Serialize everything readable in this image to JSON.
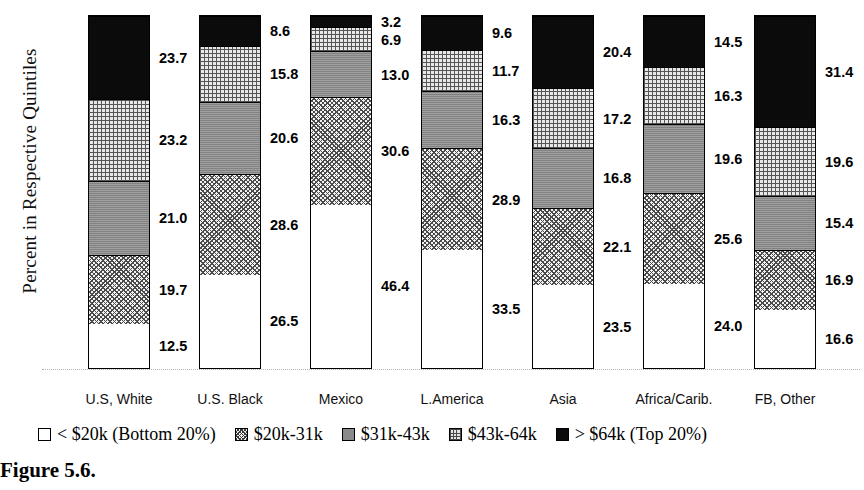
{
  "figure": {
    "caption": "Figure 5.6."
  },
  "chart_data": {
    "type": "bar",
    "stacked": true,
    "title": "",
    "xlabel": "",
    "ylabel": "Percent in Respective Quintiles",
    "ylim": [
      0,
      100
    ],
    "grid": false,
    "legend_position": "bottom",
    "categories": [
      "U.S, White",
      "U.S. Black",
      "Mexico",
      "L.America",
      "Asia",
      "Africa/Carib.",
      "FB, Other"
    ],
    "series": [
      {
        "name": "< $20k (Bottom 20%)",
        "pattern": "white",
        "values": [
          12.5,
          26.5,
          46.4,
          33.5,
          23.5,
          24.0,
          16.6
        ]
      },
      {
        "name": "$20k-31k",
        "pattern": "diagonal-dot",
        "values": [
          19.7,
          28.6,
          30.6,
          28.9,
          22.1,
          25.6,
          16.9
        ]
      },
      {
        "name": "$31k-43k",
        "pattern": "solid-gray",
        "values": [
          21.0,
          20.6,
          13.0,
          16.3,
          16.8,
          19.6,
          15.4
        ]
      },
      {
        "name": "$43k-64k",
        "pattern": "grid-hatch",
        "values": [
          23.2,
          15.8,
          6.9,
          11.7,
          17.2,
          16.3,
          19.6
        ]
      },
      {
        "name": "> $64k (Top 20%)",
        "pattern": "solid-black",
        "values": [
          23.7,
          8.6,
          3.2,
          9.6,
          20.4,
          14.5,
          31.4
        ]
      }
    ],
    "legend": [
      "< $20k (Bottom 20%)",
      "$20k-31k",
      "$31k-43k",
      "$43k-64k",
      "> $64k (Top 20%)"
    ]
  }
}
